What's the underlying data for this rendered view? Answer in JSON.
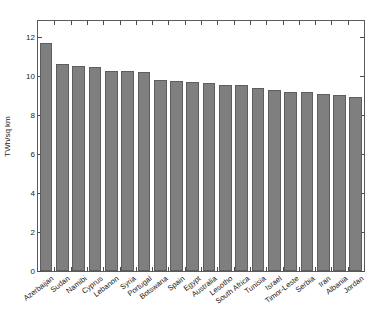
{
  "chart_data": {
    "type": "bar",
    "title": "",
    "subtitle": "",
    "xlabel": "",
    "ylabel": "TWh/sq km",
    "ylim": [
      0,
      12.8
    ],
    "yticks": [
      0,
      2,
      4,
      6,
      8,
      10,
      12
    ],
    "ytick_labels": [
      "0",
      "2",
      "4",
      "6",
      "8",
      "10",
      "12"
    ],
    "grid": false,
    "legend": null,
    "bar_color": "#7f7f7f",
    "bar_edge_color": "#5e5e5e",
    "axis_color": "#5a5a5a",
    "background_color": "#ffffff",
    "categories": [
      "Azerbaijan",
      "Sudan",
      "Namibi",
      "Cyprus",
      "Lebanon",
      "Syria",
      "Portugal",
      "Botswana",
      "Spain",
      "Egypt",
      "Australia",
      "Lesotho",
      "South Africa",
      "Tunisia",
      "Israel",
      "Timor-Leste",
      "Serbia",
      "Iran",
      "Albania",
      "Jordan"
    ],
    "values": [
      11.65,
      10.6,
      10.5,
      10.42,
      10.26,
      10.24,
      10.18,
      9.8,
      9.73,
      9.68,
      9.63,
      9.54,
      9.5,
      9.37,
      9.25,
      9.16,
      9.14,
      9.07,
      9.03,
      8.93
    ]
  }
}
